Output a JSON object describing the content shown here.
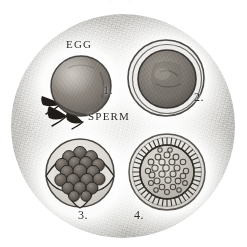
{
  "plate": {
    "kind": "microscopy-plate",
    "shape": "circular-field",
    "medium": "engraving",
    "top_remnant_text": "·   ·",
    "field": {
      "center_x": 123,
      "center_y": 126,
      "diameter": 224,
      "paper_color": "#e7e6e3",
      "ink_color": "#2e2c29",
      "halo_color": "#ffffff"
    }
  },
  "labels": {
    "egg": "EGG",
    "sperm": "SPERM",
    "fig1": "1.",
    "fig2": "2.",
    "fig3": "3.",
    "fig4": "4."
  },
  "specimens": [
    {
      "number": "1.",
      "group": "EGG",
      "name": "ovum-with-attached-spermatozoa",
      "position": "top-left",
      "center_x": 79,
      "center_y": 85,
      "radius": 29,
      "body_color": "#8b8680",
      "outline_color": "#3b3833",
      "appendages": 3,
      "appendage_color": "#221f1b",
      "description": "Shaded ovum with three dark tapered spermatozoa attached at lower left"
    },
    {
      "number": "2.",
      "group": "EGG",
      "name": "ovum-with-zona-pellucida",
      "position": "top-right",
      "center_x": 166,
      "center_y": 80,
      "radius": 32,
      "body_color": "#7f7a74",
      "outline_color": "#2f2c28",
      "membrane_rings": 2,
      "description": "Ovum enclosed by a double outer membrane ring, dark granular yolk within"
    },
    {
      "number": "3.",
      "group": "SPERM",
      "name": "ruptured-capsule-with-blastomere-cluster",
      "position": "bottom-left",
      "center_x": 79,
      "center_y": 172,
      "radius": 33,
      "body_color": "#6f6a64",
      "outline_color": "#2b2825",
      "cluster_cells": 17,
      "capsule_flaps": 3,
      "description": "Split capsule opened into flaps revealing a dark mulberry cluster of rounded cells"
    },
    {
      "number": "4.",
      "group": "SPERM",
      "name": "ciliated-vesicular-sphere",
      "position": "bottom-right",
      "center_x": 166,
      "center_y": 170,
      "radius": 36,
      "body_color": "#bab5ae",
      "outline_color": "#2f2c28",
      "cilia_count": 44,
      "vesicles": 34,
      "description": "Sphere fringed with radiating spines within a faint outer membrane, interior filled with small ring vesicles"
    }
  ]
}
